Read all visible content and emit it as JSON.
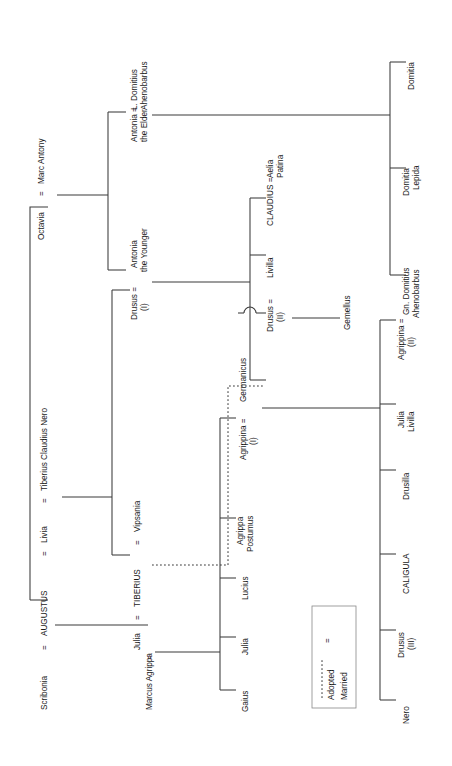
{
  "diagram": {
    "orientation": "rotated-90-ccw",
    "legend": {
      "adopted_label": "Adopted",
      "married_label": "Married",
      "married_symbol": "=",
      "adopted_symbol": "dotted-line"
    },
    "symbols": {
      "marriage": "="
    },
    "colors": {
      "line": "#3a3a3a",
      "text": "#1a1a1a",
      "legend_border": "#888888",
      "background": "#ffffff"
    },
    "people": {
      "scribonia": "Scribonia",
      "augustus": "AUGUSTUS",
      "livia": "Livia",
      "tiberius_claudius_nero": "Tiberius Claudius Nero",
      "octavia": "Octavia",
      "marc_antony": "Marc Antony",
      "antonia_the_elder_l1": "Antonia =",
      "antonia_the_elder_l2": "the Elder",
      "l_domitius_l1": "L. Domitius",
      "l_domitius_l2": "Ahenobarbus",
      "antonia_the_younger_l1": "Antonia",
      "antonia_the_younger_l2": "the Younger",
      "drusus_i_l1": "Drusus  =",
      "drusus_i_l2": "(I)",
      "tiberius": "TIBERIUS",
      "vipsania": "Vipsania",
      "julia": "Julia",
      "marcus_agrippa": "Marcus Agrippa",
      "gaius": "Gaius",
      "julia_daughter": "Julia",
      "lucius": "Lucius",
      "agrippa_postumus_l1": "Agrippa",
      "agrippa_postumus_l2": "Postumus",
      "agrippina_i_l1": "Agrippina  =",
      "agrippina_i_l2": "(I)",
      "germanicus": "Germanicus",
      "drusus_ii_l1": "Drusus  =",
      "drusus_ii_l2": "(II)",
      "livilla": "Livilla",
      "gemellus": "Gemellus",
      "claudius": "CLAUDIUS  =",
      "aelia_patina_l1": "Aelia",
      "aelia_patina_l2": "Patina",
      "domitia": "Domitia",
      "domitia_lepida_l1": "Domitia",
      "domitia_lepida_l2": "Lepida",
      "gn_domitius_l1": "Gn. Domitius",
      "gn_domitius_l2": "Ahenobarbus",
      "agrippina_ii_l1": "Agrippina  =",
      "agrippina_ii_l2": "(II)",
      "julia_livilla_l1": "Julia",
      "julia_livilla_l2": "Livilla",
      "drusilla": "Drusilla",
      "caligula": "CALIGULA",
      "drusus_iii_l1": "Drusus",
      "drusus_iii_l2": "(III)",
      "nero": "Nero"
    }
  }
}
